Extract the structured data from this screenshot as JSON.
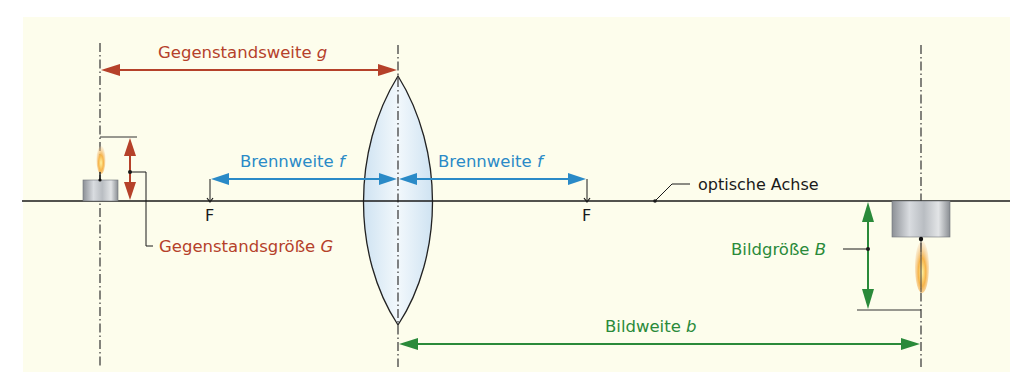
{
  "diagram": {
    "type": "converging-lens-image-formation",
    "colors": {
      "background": "#fdfdec",
      "object_color": "#b5412a",
      "focal_color": "#2a8ac7",
      "image_color": "#2a8a3a",
      "line_color": "#1a1a1a",
      "lens_fill": "#dcebf6"
    },
    "labels": {
      "object_distance": "Gegenstandsweite",
      "object_distance_symbol": "g",
      "focal_length_left": "Brennweite",
      "focal_length_left_symbol": "f",
      "focal_length_right": "Brennweite",
      "focal_length_right_symbol": "f",
      "optical_axis": "optische Achse",
      "focal_point_left": "F",
      "focal_point_right": "F",
      "object_size": "Gegenstandsgröße",
      "object_size_symbol": "G",
      "image_size": "Bildgröße",
      "image_size_symbol": "B",
      "image_distance": "Bildweite",
      "image_distance_symbol": "b"
    },
    "elements": {
      "object": "candle (upright, left of lens)",
      "lens": "biconvex converging lens",
      "image": "candle (inverted, enlarged, right of lens)"
    }
  }
}
